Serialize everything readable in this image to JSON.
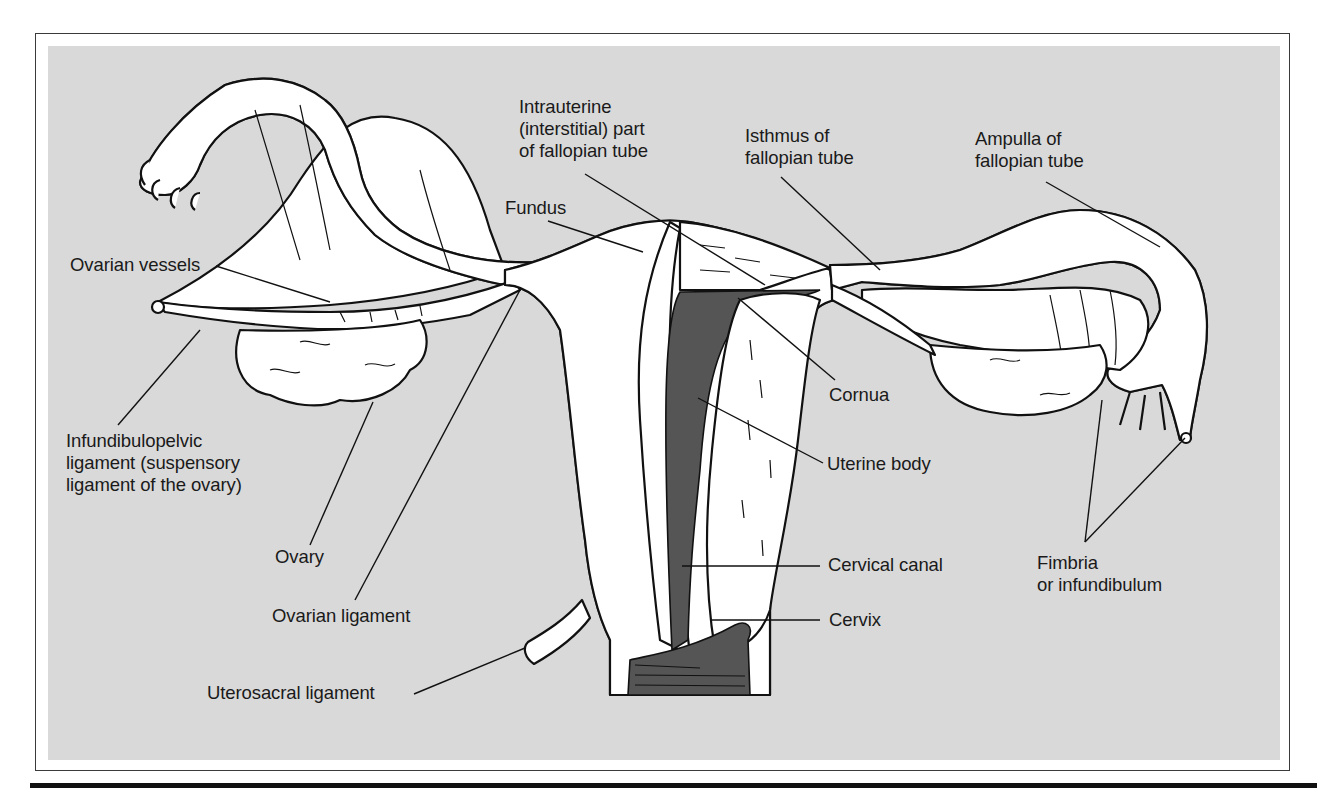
{
  "figure": {
    "type": "anatomical illustration",
    "colors": {
      "panel_background": "#d9d9d9",
      "frame_border": "#3a3a3a",
      "organ_fill": "#ffffff",
      "cavity_fill": "#555555",
      "ink": "#111111",
      "rule_bar": "#111111"
    }
  },
  "labels": [
    {
      "id": "ovarian-vessels",
      "text": "Ovarian vessels",
      "x": 70,
      "y": 254,
      "line": [
        [
          216,
          266
        ],
        [
          330,
          302
        ]
      ]
    },
    {
      "id": "infundibulopelvic-ligament",
      "text": "Infundibulopelvic\nligament (suspensory\nligament of the ovary)",
      "x": 66,
      "y": 430,
      "line": [
        [
          118,
          425
        ],
        [
          200,
          330
        ]
      ]
    },
    {
      "id": "ovary",
      "text": "Ovary",
      "x": 275,
      "y": 546,
      "line": [
        [
          310,
          545
        ],
        [
          373,
          402
        ]
      ]
    },
    {
      "id": "ovarian-ligament",
      "text": "Ovarian ligament",
      "x": 272,
      "y": 605,
      "line": [
        [
          355,
          600
        ],
        [
          520,
          290
        ]
      ]
    },
    {
      "id": "uterosacral-ligament",
      "text": "Uterosacral ligament",
      "x": 207,
      "y": 682,
      "line": [
        [
          414,
          694
        ],
        [
          525,
          648
        ]
      ]
    },
    {
      "id": "fundus",
      "text": "Fundus",
      "x": 505,
      "y": 197,
      "line": [
        [
          548,
          221
        ],
        [
          643,
          252
        ]
      ]
    },
    {
      "id": "intrauterine-part",
      "text": "Intrauterine\n(interstitial) part\nof fallopian tube",
      "x": 519,
      "y": 96,
      "line": [
        [
          585,
          174
        ],
        [
          765,
          285
        ]
      ]
    },
    {
      "id": "isthmus",
      "text": "Isthmus of\nfallopian tube",
      "x": 745,
      "y": 125,
      "line": [
        [
          781,
          177
        ],
        [
          880,
          270
        ]
      ]
    },
    {
      "id": "ampulla",
      "text": "Ampulla of\nfallopian tube",
      "x": 975,
      "y": 128,
      "line": [
        [
          1046,
          182
        ],
        [
          1160,
          247
        ]
      ]
    },
    {
      "id": "cornua",
      "text": "Cornua",
      "x": 829,
      "y": 384,
      "line": [
        [
          835,
          380
        ],
        [
          738,
          298
        ]
      ]
    },
    {
      "id": "uterine-body",
      "text": "Uterine body",
      "x": 827,
      "y": 453,
      "line": [
        [
          823,
          463
        ],
        [
          698,
          398
        ]
      ]
    },
    {
      "id": "cervical-canal",
      "text": "Cervical canal",
      "x": 828,
      "y": 554,
      "line": [
        [
          820,
          566
        ],
        [
          682,
          566
        ]
      ]
    },
    {
      "id": "cervix",
      "text": "Cervix",
      "x": 829,
      "y": 609,
      "line": [
        [
          820,
          620
        ],
        [
          710,
          620
        ]
      ]
    },
    {
      "id": "fimbria",
      "text": "Fimbria\nor infundibulum",
      "x": 1037,
      "y": 552,
      "line": [
        [
          1085,
          542
        ],
        [
          1102,
          400
        ]
      ],
      "line2": [
        [
          1085,
          542
        ],
        [
          1185,
          438
        ]
      ]
    }
  ]
}
